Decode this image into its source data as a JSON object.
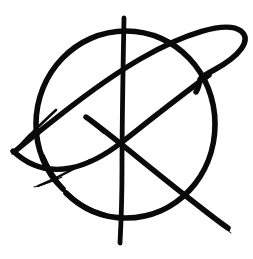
{
  "canvas": {
    "width": 253,
    "height": 259,
    "background_color": "#ffffff",
    "ink_color": "#0a0a0a",
    "title": "Hand-drawn circled symbol"
  },
  "artwork": {
    "name": "anarchy-style-glyph",
    "description": "Hand-drawn black ink glyph: an open circle overlaid by a long tilted ellipse loop, a vertical stroke and two crossing diagonal strokes meeting near the centre",
    "medium": "brush-ink",
    "stroke_count": 5,
    "strokes": [
      {
        "id": "circle",
        "name": "open-circle-stroke",
        "kind": "arc",
        "center": [
          126,
          124
        ],
        "radius_x": 88,
        "radius_y": 94,
        "gap_start_deg": 150,
        "gap_end_deg": 196,
        "width_min": 3.0,
        "width_max": 6.2,
        "path": "M 63 189 C 45 172 36 148 36 124 C 36 73 76 31 126 31 C 176 31 215 73 215 124 C 215 176 176 218 126 218 C 103 218 82 209 66 193"
      },
      {
        "id": "ellipse-loop",
        "name": "tilted-ellipse-loop-stroke",
        "kind": "open-loop",
        "tip_start": [
          14,
          152
        ],
        "apex": [
          244,
          33
        ],
        "tip_end": [
          196,
          92
        ],
        "width_min": 1.0,
        "width_max": 6.0,
        "path": "M 14 152 C 52 121 100 82 142 58 C 184 34 226 20 241 31 C 252 40 240 56 214 70 C 190 83 205 77 196 92"
      },
      {
        "id": "vertical",
        "name": "vertical-stroke",
        "kind": "line",
        "from": [
          124,
          18
        ],
        "to": [
          121,
          243
        ],
        "width_min": 2.0,
        "width_max": 5.5,
        "path": "M 124 18 C 123 70 122 120 122 170 C 122 200 121 224 120 243"
      },
      {
        "id": "diagonal-long",
        "name": "long-diagonal-stroke",
        "kind": "line",
        "from": [
          208,
          76
        ],
        "to": [
          13,
          151
        ],
        "width_min": 0.8,
        "width_max": 6.0,
        "path": "M 209 75 C 180 96 150 120 122 142 C 94 164 50 186 13 151"
      },
      {
        "id": "diagonal-short",
        "name": "short-diagonal-stroke",
        "kind": "line",
        "from": [
          86,
          117
        ],
        "to": [
          228,
          228
        ],
        "width_min": 1.0,
        "width_max": 6.0,
        "path": "M 86 117 C 110 134 150 168 186 196 C 205 211 219 222 228 228"
      }
    ]
  }
}
